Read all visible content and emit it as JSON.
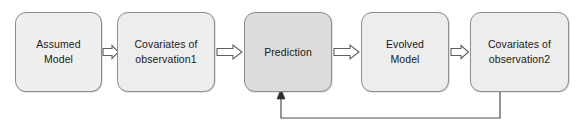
{
  "diagram": {
    "type": "flowchart",
    "orientation": "left-to-right",
    "canvas": {
      "width": 579,
      "height": 132,
      "background": "#ffffff"
    },
    "style": {
      "node_fill_default": "#ececec",
      "node_fill_highlight": "#dedede",
      "node_border": "#8c8c8c",
      "arrow_stroke": "#5a5a5a",
      "arrow_fill": "#ffffff",
      "feedback_stroke": "#4d4d4d",
      "text_color": "#1a1a1a"
    },
    "nodes": [
      {
        "id": "assumed-model",
        "lines": [
          "Assumed",
          "Model"
        ],
        "x": 15,
        "y": 12,
        "w": 87,
        "h": 80,
        "fill": "#efefef"
      },
      {
        "id": "covariates-observation1",
        "lines": [
          "Covariates of",
          "observation1"
        ],
        "x": 117,
        "y": 12,
        "w": 98,
        "h": 80,
        "fill": "#ededed"
      },
      {
        "id": "prediction",
        "lines": [
          "Prediction"
        ],
        "x": 244,
        "y": 12,
        "w": 88,
        "h": 80,
        "fill": "#dcdcdc"
      },
      {
        "id": "evolved-model",
        "lines": [
          "Evolved",
          "Model"
        ],
        "x": 361,
        "y": 12,
        "w": 88,
        "h": 80,
        "fill": "#ededed"
      },
      {
        "id": "covariates-observation2",
        "lines": [
          "Covariates of",
          "observation2"
        ],
        "x": 470,
        "y": 12,
        "w": 99,
        "h": 80,
        "fill": "#ededed"
      }
    ],
    "connectors": [
      {
        "id": "arrow-assumed-to-covariates1",
        "kind": "block-arrow",
        "from": "assumed-model",
        "to": "covariates-observation1",
        "x1": 102,
        "x2": 117,
        "y": 52
      },
      {
        "id": "arrow-covariates1-to-prediction",
        "kind": "block-arrow",
        "from": "covariates-observation1",
        "to": "prediction",
        "x1": 215,
        "x2": 244,
        "y": 52
      },
      {
        "id": "arrow-prediction-to-evolved",
        "kind": "block-arrow",
        "from": "prediction",
        "to": "evolved-model",
        "x1": 332,
        "x2": 361,
        "y": 52
      },
      {
        "id": "arrow-evolved-to-covariates2",
        "kind": "block-arrow",
        "from": "evolved-model",
        "to": "covariates-observation2",
        "x1": 449,
        "x2": 470,
        "y": 52
      },
      {
        "id": "feedback-covariates2-to-prediction",
        "kind": "feedback-line",
        "from": "covariates-observation2",
        "to": "prediction",
        "down_x": 500,
        "bottom_y": 118,
        "up_x": 281,
        "top_y": 93
      }
    ]
  }
}
